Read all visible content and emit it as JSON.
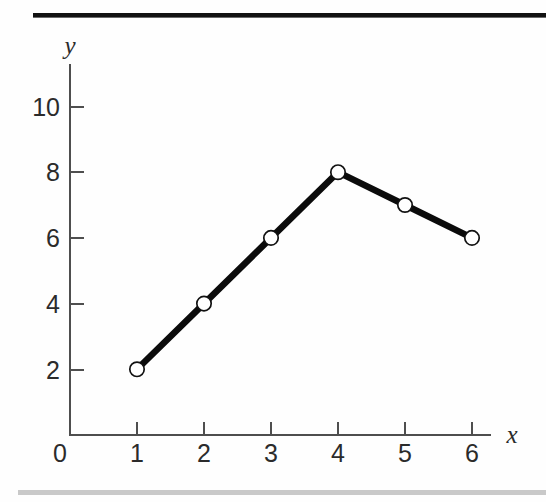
{
  "figure": {
    "background_color": "#fefefe",
    "rule_top_color": "#121212",
    "rule_bottom_color": "#c9c9c9"
  },
  "chart_data": {
    "type": "line",
    "title": "",
    "subtitle": "",
    "xlabel": "x",
    "ylabel": "y",
    "x": [
      1,
      2,
      3,
      4,
      5,
      6
    ],
    "values": [
      2,
      4,
      6,
      8,
      7,
      6
    ],
    "series": [
      {
        "name": "",
        "x": [
          1,
          2,
          3,
          4,
          5,
          6
        ],
        "values": [
          2,
          4,
          6,
          8,
          7,
          6
        ]
      }
    ],
    "points": [
      {
        "x": 1,
        "y": 2
      },
      {
        "x": 2,
        "y": 4
      },
      {
        "x": 3,
        "y": 6
      },
      {
        "x": 4,
        "y": 8
      },
      {
        "x": 5,
        "y": 7
      },
      {
        "x": 6,
        "y": 6
      }
    ],
    "xlim": [
      0,
      6.5
    ],
    "ylim": [
      0,
      11.4
    ],
    "x_ticks": [
      1,
      2,
      3,
      4,
      5,
      6
    ],
    "x_tick_labels": [
      "1",
      "2",
      "3",
      "4",
      "5",
      "6"
    ],
    "y_ticks": [
      2,
      4,
      6,
      8,
      10
    ],
    "y_tick_labels": [
      "2",
      "4",
      "6",
      "8",
      "10"
    ],
    "origin_label": "0",
    "grid": false,
    "legend": false,
    "legend_position": "none",
    "marker": "open-circle",
    "marker_face_color": "#ffffff",
    "marker_edge_color": "#111111",
    "line_color": "#0b0b0b",
    "axis_color": "#4e4e4e",
    "annotations": []
  }
}
